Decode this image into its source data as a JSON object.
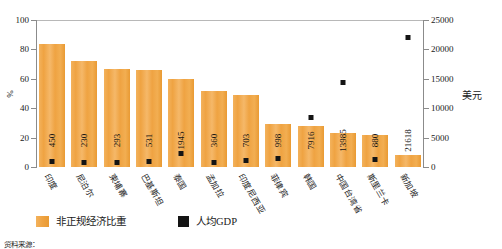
{
  "chart_data": {
    "type": "bar",
    "title": "",
    "subtitle": "",
    "categories": [
      "印度",
      "尼泊尔",
      "柬埔寨",
      "巴基斯坦",
      "泰国",
      "孟加拉",
      "印度尼西亚",
      "菲律宾",
      "韩国",
      "中国台湾省",
      "斯里兰卡",
      "新加坡"
    ],
    "series": [
      {
        "name": "非正规经济比重",
        "unit": "%",
        "axis": "left",
        "color": "#efa342",
        "values": [
          84,
          72,
          67,
          66,
          60,
          52,
          49,
          29,
          28,
          23,
          21.5,
          8.5
        ]
      },
      {
        "name": "人均GDP",
        "unit": "美元",
        "axis": "right",
        "color": "#141414",
        "values": [
          450,
          230,
          293,
          531,
          1945,
          360,
          703,
          998,
          7916,
          13985,
          880,
          21618
        ]
      }
    ],
    "xlabel": "",
    "ylabel": "%",
    "ylabel_right": "美元",
    "ylim": [
      0,
      100
    ],
    "ylim_right": [
      0,
      25000
    ],
    "yticks": [
      "0",
      "20",
      "40",
      "60",
      "80",
      "100"
    ],
    "yticks_right": [
      "0",
      "5000",
      "10000",
      "15000",
      "20000",
      "25000"
    ],
    "grid": false,
    "legend_position": "bottom-left"
  },
  "axes": {
    "left_title": "%",
    "right_title": "美元",
    "left_ticks": [
      "100",
      "80",
      "60",
      "40",
      "20",
      "0"
    ],
    "right_ticks": [
      "25000",
      "20000",
      "15000",
      "10000",
      "5000",
      "0"
    ]
  },
  "legend": {
    "items": [
      {
        "label": "非正规经济比重",
        "swatch": "orange-square-icon"
      },
      {
        "label": "人均GDP",
        "swatch": "black-square-icon"
      }
    ]
  },
  "footer": {
    "source_note": "资料来源："
  }
}
